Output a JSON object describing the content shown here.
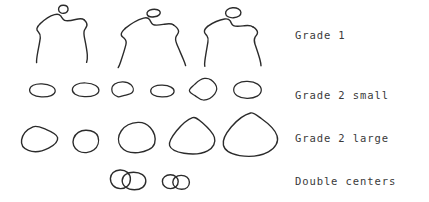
{
  "figure": {
    "background_color": "#ffffff",
    "stroke_color": "#2b2b2b",
    "label_color": "#3a3a3a",
    "width": 429,
    "height": 202
  },
  "rows": [
    {
      "id": "grade-1",
      "label": "Grade 1",
      "shape_kind": "torso-with-head",
      "shape_count": 3,
      "description": "hand-drawn shoulder/torso outlines each topped by a small oval head"
    },
    {
      "id": "grade-2-small",
      "label": "Grade 2 small",
      "shape_kind": "small-oval",
      "shape_count": 6,
      "description": "row of six small hand-drawn ovals"
    },
    {
      "id": "grade-2-large",
      "label": "Grade 2 large",
      "shape_kind": "large-rounded-triangle",
      "shape_count": 5,
      "description": "row of five larger hand-drawn rounded shapes increasing in size left to right"
    },
    {
      "id": "double-centers",
      "label": "Double centers",
      "shape_kind": "overlapping-oval-pair",
      "shape_count": 2,
      "description": "two pairs of overlapping ovals"
    }
  ]
}
